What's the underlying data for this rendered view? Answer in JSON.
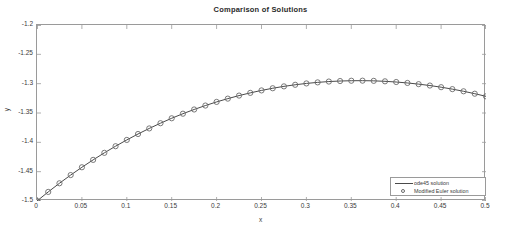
{
  "chart_data": {
    "type": "line",
    "title": "Comparison of Solutions",
    "xlabel": "x",
    "ylabel": "y",
    "xlim": [
      0,
      0.5
    ],
    "ylim": [
      -1.5,
      -1.2
    ],
    "grid": false,
    "legend_position": "bottom-right",
    "xticks": [
      "0",
      "0.05",
      "0.1",
      "0.15",
      "0.2",
      "0.25",
      "0.3",
      "0.35",
      "0.4",
      "0.45",
      "0.5"
    ],
    "xtick_values": [
      0,
      0.05,
      0.1,
      0.15,
      0.2,
      0.25,
      0.3,
      0.35,
      0.4,
      0.45,
      0.5
    ],
    "yticks": [
      "-1.2",
      "-1.25",
      "-1.3",
      "-1.35",
      "-1.4",
      "-1.45",
      "-1.5"
    ],
    "ytick_values": [
      -1.2,
      -1.25,
      -1.3,
      -1.35,
      -1.4,
      -1.45,
      -1.5
    ],
    "series": [
      {
        "name": "ode45 solution",
        "style": "line",
        "color": "#4a4a4a",
        "x": [
          0,
          0.0125,
          0.025,
          0.0375,
          0.05,
          0.0625,
          0.075,
          0.0875,
          0.1,
          0.1125,
          0.125,
          0.1375,
          0.15,
          0.1625,
          0.175,
          0.1875,
          0.2,
          0.2125,
          0.225,
          0.2375,
          0.25,
          0.2625,
          0.275,
          0.2875,
          0.3,
          0.3125,
          0.325,
          0.3375,
          0.35,
          0.3625,
          0.375,
          0.3875,
          0.4,
          0.4125,
          0.425,
          0.4375,
          0.45,
          0.4625,
          0.475,
          0.4875,
          0.5
        ],
        "y": [
          -1.5,
          -1.4845,
          -1.4698,
          -1.4558,
          -1.4425,
          -1.4299,
          -1.4179,
          -1.4066,
          -1.3959,
          -1.3858,
          -1.3763,
          -1.3674,
          -1.359,
          -1.3512,
          -1.344,
          -1.3373,
          -1.3311,
          -1.3255,
          -1.3203,
          -1.3157,
          -1.3115,
          -1.3078,
          -1.3046,
          -1.3019,
          -1.2996,
          -1.2978,
          -1.2964,
          -1.2955,
          -1.295,
          -1.2949,
          -1.2952,
          -1.296,
          -1.2972,
          -1.2988,
          -1.3008,
          -1.3032,
          -1.306,
          -1.3093,
          -1.313,
          -1.3171,
          -1.3216
        ]
      },
      {
        "name": "Modified Euler solution",
        "style": "marker",
        "marker": "circle",
        "color": "#6a6a6a",
        "x": [
          0,
          0.0125,
          0.025,
          0.0375,
          0.05,
          0.0625,
          0.075,
          0.0875,
          0.1,
          0.1125,
          0.125,
          0.1375,
          0.15,
          0.1625,
          0.175,
          0.1875,
          0.2,
          0.2125,
          0.225,
          0.2375,
          0.25,
          0.2625,
          0.275,
          0.2875,
          0.3,
          0.3125,
          0.325,
          0.3375,
          0.35,
          0.3625,
          0.375,
          0.3875,
          0.4,
          0.4125,
          0.425,
          0.4375,
          0.45,
          0.4625,
          0.475,
          0.4875,
          0.5
        ],
        "y": [
          -1.5,
          -1.4845,
          -1.4698,
          -1.4558,
          -1.4425,
          -1.4299,
          -1.4179,
          -1.4066,
          -1.3959,
          -1.3858,
          -1.3763,
          -1.3674,
          -1.359,
          -1.3512,
          -1.344,
          -1.3373,
          -1.3311,
          -1.3255,
          -1.3203,
          -1.3157,
          -1.3115,
          -1.3078,
          -1.3046,
          -1.3019,
          -1.2996,
          -1.2978,
          -1.2964,
          -1.2955,
          -1.295,
          -1.2949,
          -1.2952,
          -1.296,
          -1.2972,
          -1.2988,
          -1.3008,
          -1.3032,
          -1.306,
          -1.3093,
          -1.313,
          -1.3171,
          -1.3216
        ]
      }
    ],
    "legend": [
      {
        "label": "ode45 solution",
        "key": "line"
      },
      {
        "label": "Modified Euler solution",
        "key": "circle-marker"
      }
    ]
  }
}
